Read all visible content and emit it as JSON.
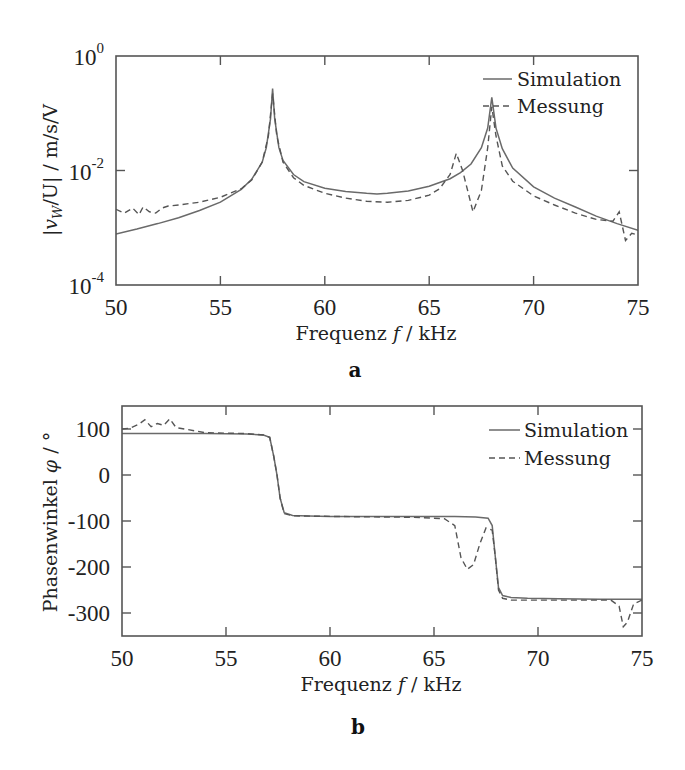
{
  "chart_data": [
    {
      "panel": "a",
      "type": "line",
      "yscale": "log",
      "xlabel": "Frequenz f / kHz",
      "ylabel": "|v_W/U| / m/s/V",
      "xlim": [
        50,
        75
      ],
      "ylim": [
        0.0001,
        1
      ],
      "xticks": [
        50,
        55,
        60,
        65,
        70,
        75
      ],
      "yticks": [
        {
          "value": 1,
          "label": "10",
          "exp": "0"
        },
        {
          "value": 0.01,
          "label": "10",
          "exp": "-2"
        },
        {
          "value": 0.0001,
          "label": "10",
          "exp": "-4"
        }
      ],
      "grid": false,
      "legend_position": "upper right",
      "series": [
        {
          "name": "Simulation",
          "style": "solid",
          "x": [
            50,
            51,
            52,
            53,
            54,
            55,
            56,
            56.5,
            57,
            57.2,
            57.4,
            57.5,
            57.6,
            57.8,
            58,
            58.5,
            59,
            60,
            61,
            62,
            62.5,
            63,
            64,
            65,
            66,
            66.5,
            67,
            67.5,
            67.8,
            68,
            68.2,
            68.5,
            69,
            70,
            71,
            72,
            73,
            74,
            75
          ],
          "y": [
            0.00078,
            0.00095,
            0.00118,
            0.0015,
            0.002,
            0.0028,
            0.0047,
            0.007,
            0.014,
            0.025,
            0.08,
            0.27,
            0.08,
            0.025,
            0.015,
            0.0085,
            0.0064,
            0.0049,
            0.0043,
            0.004,
            0.0039,
            0.004,
            0.0044,
            0.0053,
            0.0072,
            0.0092,
            0.013,
            0.025,
            0.055,
            0.19,
            0.055,
            0.024,
            0.011,
            0.0052,
            0.0033,
            0.0023,
            0.0016,
            0.00118,
            0.0009
          ]
        },
        {
          "name": "Messung",
          "style": "dashed",
          "x": [
            50,
            50.4,
            50.8,
            51.1,
            51.3,
            51.6,
            51.9,
            52.2,
            52.5,
            53,
            54,
            55,
            56,
            56.5,
            57,
            57.3,
            57.5,
            57.7,
            58,
            58.5,
            59,
            60,
            61,
            62,
            63,
            64,
            65,
            65.5,
            66,
            66.3,
            66.6,
            67.1,
            67.5,
            67.8,
            68,
            68.2,
            68.5,
            69,
            70,
            71,
            72,
            73,
            73.8,
            74.1,
            74.4,
            74.7,
            75
          ],
          "y": [
            0.0021,
            0.0018,
            0.0022,
            0.0017,
            0.0023,
            0.0019,
            0.0018,
            0.0022,
            0.0024,
            0.0025,
            0.0028,
            0.0034,
            0.0048,
            0.0068,
            0.014,
            0.04,
            0.22,
            0.04,
            0.014,
            0.0075,
            0.0055,
            0.004,
            0.0033,
            0.0029,
            0.0028,
            0.003,
            0.0037,
            0.0048,
            0.0085,
            0.02,
            0.01,
            0.0019,
            0.0045,
            0.025,
            0.13,
            0.04,
            0.012,
            0.0065,
            0.0036,
            0.0025,
            0.0018,
            0.0014,
            0.0013,
            0.0019,
            0.0006,
            0.0008,
            0.00075
          ]
        }
      ]
    },
    {
      "panel": "b",
      "type": "line",
      "xlabel": "Frequenz f / kHz",
      "ylabel": "Phasenwinkel φ / °",
      "xlim": [
        50,
        75
      ],
      "ylim": [
        -350,
        150
      ],
      "xticks": [
        50,
        55,
        60,
        65,
        70,
        75
      ],
      "yticks": [
        100,
        0,
        -100,
        -200,
        -300
      ],
      "grid": false,
      "legend_position": "upper right",
      "series": [
        {
          "name": "Simulation",
          "style": "solid",
          "x": [
            50,
            52,
            54,
            56,
            56.8,
            57.1,
            57.3,
            57.45,
            57.6,
            57.8,
            58.2,
            59,
            60,
            62,
            64,
            66,
            67,
            67.6,
            67.8,
            67.95,
            68.1,
            68.3,
            68.7,
            69.5,
            71,
            73,
            75
          ],
          "y": [
            90,
            90,
            90,
            89,
            87,
            82,
            40,
            0,
            -50,
            -82,
            -88,
            -89,
            -90,
            -90,
            -90,
            -90,
            -91,
            -94,
            -110,
            -180,
            -245,
            -262,
            -266,
            -268,
            -269,
            -270,
            -270
          ]
        },
        {
          "name": "Messung",
          "style": "dashed",
          "x": [
            50,
            50.4,
            50.8,
            51.1,
            51.4,
            51.7,
            52,
            52.3,
            52.6,
            53,
            53.5,
            54,
            56,
            56.8,
            57.1,
            57.3,
            57.45,
            57.6,
            57.8,
            58.2,
            60,
            62,
            64,
            65.5,
            66,
            66.3,
            66.6,
            66.9,
            67.2,
            67.5,
            67.8,
            67.95,
            68.1,
            68.3,
            68.7,
            70,
            72,
            73.5,
            73.9,
            74.1,
            74.3,
            74.6,
            75
          ],
          "y": [
            100,
            102,
            110,
            120,
            105,
            112,
            108,
            122,
            103,
            100,
            96,
            92,
            90,
            87,
            82,
            40,
            0,
            -50,
            -84,
            -89,
            -90,
            -91,
            -92,
            -95,
            -110,
            -180,
            -205,
            -195,
            -150,
            -115,
            -120,
            -180,
            -250,
            -268,
            -272,
            -272,
            -272,
            -272,
            -285,
            -330,
            -320,
            -280,
            -272
          ]
        }
      ]
    }
  ],
  "panels": {
    "a": {
      "label": "a",
      "xlabel_text": "Frequenz",
      "xlabel_var": "f",
      "xlabel_unit": "/ kHz",
      "ylabel_text": "|v",
      "ylabel_sub": "W",
      "ylabel_rest": "/U| / m/s/V",
      "legend": [
        "Simulation",
        "Messung"
      ]
    },
    "b": {
      "label": "b",
      "xlabel_text": "Frequenz",
      "xlabel_var": "f",
      "xlabel_unit": "/ kHz",
      "ylabel_text": "Phasenwinkel",
      "ylabel_var": "φ",
      "ylabel_unit": "/ °",
      "legend": [
        "Simulation",
        "Messung"
      ]
    }
  },
  "layout": {
    "a": {
      "left": 116,
      "right": 638,
      "top": 56,
      "bottom": 285
    },
    "b": {
      "left": 122,
      "right": 642,
      "top": 406,
      "bottom": 636
    }
  },
  "colors": {
    "simulation": "#6a6a6a",
    "messung": "#555555",
    "frame": "#555555"
  }
}
